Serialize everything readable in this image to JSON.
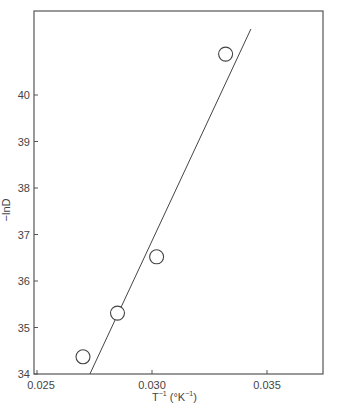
{
  "chart_data": {
    "type": "scatter",
    "title": "",
    "xlabel": "T⁻¹ (°K⁻¹)",
    "ylabel": "−lnD",
    "xlim": [
      0.025,
      0.0373
    ],
    "ylim": [
      34,
      41.8
    ],
    "x_ticks": [
      0.025,
      0.03,
      0.035
    ],
    "x_tick_labels": [
      "0.025",
      "0.030",
      "0.035"
    ],
    "y_ticks": [
      34,
      35,
      36,
      37,
      38,
      39,
      40
    ],
    "y_tick_labels": [
      "34",
      "35",
      "36",
      "37",
      "38",
      "39",
      "40"
    ],
    "grid": false,
    "legend": null,
    "series": [
      {
        "name": "data",
        "marker": "open-circle",
        "points": [
          {
            "x": 0.027,
            "y": 34.37
          },
          {
            "x": 0.0285,
            "y": 35.31
          },
          {
            "x": 0.0302,
            "y": 36.52
          },
          {
            "x": 0.0332,
            "y": 40.88
          }
        ]
      },
      {
        "name": "fit",
        "type": "line",
        "points": [
          {
            "x": 0.0273,
            "y": 34.0
          },
          {
            "x": 0.0343,
            "y": 41.42
          }
        ]
      }
    ]
  },
  "axes": {
    "x_title_main": "T",
    "x_title_sup1": "−1",
    "x_title_unit_open": " (°K",
    "x_title_sup2": "−1",
    "x_title_unit_close": ")",
    "y_title": "−lnD"
  }
}
